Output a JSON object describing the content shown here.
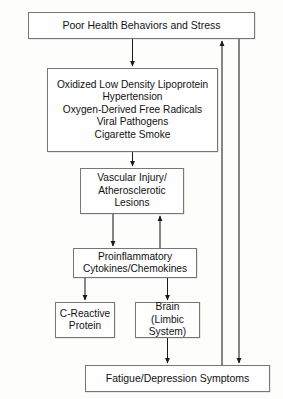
{
  "diagram": {
    "type": "flowchart",
    "canvas": {
      "width": 283,
      "height": 399
    },
    "colors": {
      "background": "#fdfdfb",
      "box_fill": "#fefefe",
      "box_border": "#777676",
      "edge_stroke": "#1a1a1a",
      "text": "#121212"
    },
    "nodes": [
      {
        "id": "poor_health",
        "label": "Poor Health Behaviors and Stress"
      },
      {
        "id": "risk_factors",
        "label": "Oxidized Low Density Lipoprotein\nHypertension\nOxygen-Derived Free Radicals\nViral Pathogens\nCigarette Smoke",
        "lines": [
          "Oxidized Low Density Lipoprotein",
          "Hypertension",
          "Oxygen-Derived Free Radicals",
          "Viral Pathogens",
          "Cigarette Smoke"
        ]
      },
      {
        "id": "vascular_injury",
        "label": "Vascular Injury/\nAtherosclerotic\nLesions",
        "lines": [
          "Vascular Injury/",
          "Atherosclerotic",
          "Lesions"
        ]
      },
      {
        "id": "proinflammatory",
        "label": "Proinflammatory\nCytokines/Chemokines",
        "lines": [
          "Proinflammatory",
          "Cytokines/Chemokines"
        ]
      },
      {
        "id": "c_reactive_protein",
        "label": "C-Reactive\nProtein",
        "lines": [
          "C-Reactive",
          "Protein"
        ]
      },
      {
        "id": "brain",
        "label": "Brain\n(Limbic System)",
        "lines": [
          "Brain",
          "(Limbic System)"
        ]
      },
      {
        "id": "fatigue_depression",
        "label": "Fatigue/Depression Symptoms"
      }
    ],
    "edges": [
      {
        "id": "e1",
        "from": "poor_health",
        "to": "risk_factors",
        "style": "arrow-down"
      },
      {
        "id": "e2",
        "from": "risk_factors",
        "to": "vascular_injury",
        "style": "arrow-down"
      },
      {
        "id": "e3",
        "from": "vascular_injury",
        "to": "proinflammatory",
        "style": "arrow-down"
      },
      {
        "id": "e4",
        "from": "proinflammatory",
        "to": "vascular_injury",
        "style": "arrow-up"
      },
      {
        "id": "e5",
        "from": "proinflammatory",
        "to": "c_reactive_protein",
        "style": "arrow-down"
      },
      {
        "id": "e6",
        "from": "proinflammatory",
        "to": "brain",
        "style": "arrow-down"
      },
      {
        "id": "e7",
        "from": "brain",
        "to": "fatigue_depression",
        "style": "arrow-down"
      },
      {
        "id": "e8",
        "from": "fatigue_depression",
        "to": "poor_health",
        "style": "feedback-up-right"
      },
      {
        "id": "e9",
        "from": "poor_health",
        "to": "fatigue_depression",
        "style": "feedback-down-right"
      }
    ]
  }
}
